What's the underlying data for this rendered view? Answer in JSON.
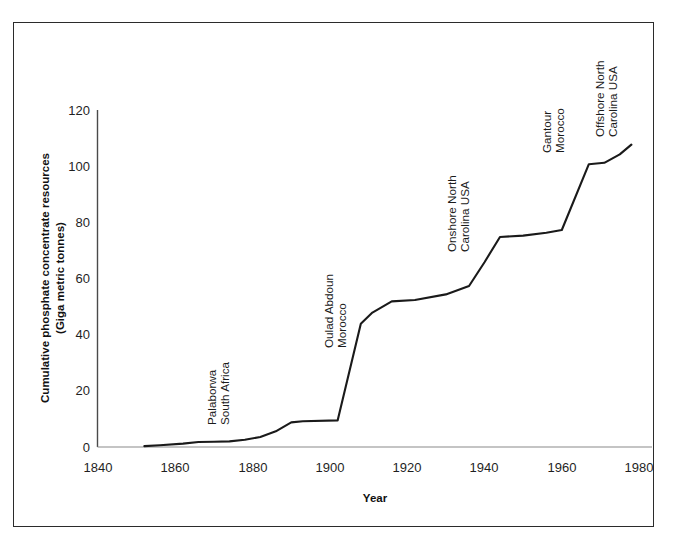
{
  "figure": {
    "background_color": "#ffffff",
    "frame_color": "#2b2b2b",
    "line_color": "#1a1a1a",
    "axis_color": "#4a4a4a"
  },
  "chart_data": {
    "type": "line",
    "title": "",
    "subtitle": "",
    "xlabel": "Year",
    "ylabel": "Cumulative phosphate concentrate resources (Giga metric tonnes)",
    "ylabel_line1": "Cumulative phosphate concentrate resources",
    "ylabel_line2": "(Giga metric tonnes)",
    "xlim": [
      1840,
      1985
    ],
    "ylim": [
      0,
      120
    ],
    "xticks": [
      1840,
      1860,
      1880,
      1900,
      1920,
      1940,
      1960,
      1980
    ],
    "yticks": [
      0,
      20,
      40,
      60,
      80,
      100,
      120
    ],
    "grid": false,
    "legend": "none",
    "series": [
      {
        "name": "Cumulative phosphate concentrate resources",
        "x": [
          1852,
          1856,
          1862,
          1866,
          1870,
          1874,
          1878,
          1882,
          1886,
          1890,
          1893,
          1902,
          1908,
          1911,
          1916,
          1922,
          1930,
          1936,
          1940,
          1944,
          1950,
          1956,
          1960,
          1967,
          1971,
          1975,
          1978
        ],
        "values": [
          0.3,
          0.6,
          1.2,
          1.8,
          1.9,
          2.0,
          2.6,
          3.6,
          5.6,
          8.8,
          9.2,
          9.5,
          44.0,
          48.0,
          52.0,
          52.5,
          54.5,
          57.5,
          66.0,
          75.0,
          75.5,
          76.5,
          77.5,
          101.0,
          101.5,
          104.5,
          108.0
        ]
      }
    ],
    "annotations": [
      {
        "id": "palaborwa",
        "line1": "Palaborwa",
        "line2": "South Africa",
        "x_year": 1890,
        "y_value": 9,
        "orientation": "vertical"
      },
      {
        "id": "oulad-abdoun",
        "line1": "Oulad Abdoun",
        "line2": "Morocco",
        "x_year": 1908,
        "y_value": 44,
        "orientation": "vertical"
      },
      {
        "id": "onshore-north-carolina",
        "line1": "Onshore North",
        "line2": "Carolina USA",
        "x_year": 1944,
        "y_value": 75,
        "orientation": "vertical"
      },
      {
        "id": "gantour",
        "line1": "Gantour",
        "line2": "Morocco",
        "x_year": 1967,
        "y_value": 101,
        "orientation": "vertical"
      },
      {
        "id": "offshore-north-carolina",
        "line1": "Offshore North",
        "line2": "Carolina USA",
        "x_year": 1978,
        "y_value": 108,
        "orientation": "vertical"
      }
    ]
  }
}
